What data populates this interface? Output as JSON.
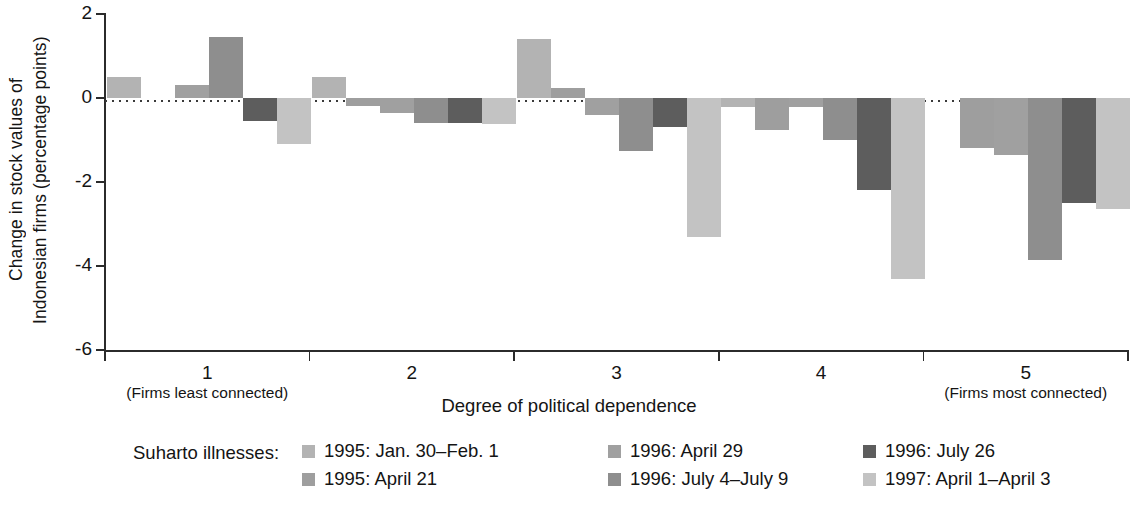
{
  "chart_data": {
    "type": "bar",
    "title": "",
    "xlabel": "Degree of political dependence",
    "ylabel": "Change in stock values of Indonesian firms (percentage points)",
    "ylabel_line1": "Change in stock values of",
    "ylabel_line2": "Indonesian firms (percentage points)",
    "ylim": [
      -6,
      2
    ],
    "yticks": [
      2,
      0,
      -2,
      -4,
      -6
    ],
    "ytick_labels": [
      "2",
      "0",
      "-2",
      "-4",
      "-6"
    ],
    "grid": false,
    "zero_line": true,
    "legend_position": "below",
    "legend_title": "Suharto illnesses:",
    "categories": [
      "1",
      "2",
      "3",
      "4",
      "5"
    ],
    "category_sublabels": [
      "(Firms least connected)",
      "",
      "",
      "",
      "(Firms most connected)"
    ],
    "series": [
      {
        "name": "1995: Jan. 30–Feb. 1",
        "color": "#b3b3b3",
        "values": [
          0.5,
          0.5,
          1.4,
          -0.22,
          null
        ]
      },
      {
        "name": "1995: April 21",
        "color": "#9e9e9e",
        "values": [
          null,
          -0.18,
          0.25,
          -0.75,
          -1.2
        ]
      },
      {
        "name": "1996: April 29",
        "color": "#a0a0a0",
        "values": [
          0.3,
          -0.35,
          -0.4,
          -0.22,
          -1.35
        ]
      },
      {
        "name": "1996: July 4–July 9",
        "color": "#8e8e8e",
        "values": [
          1.45,
          -0.6,
          -1.25,
          -1.0,
          -3.85
        ]
      },
      {
        "name": "1996: July 26",
        "color": "#5d5d5d",
        "values": [
          -0.55,
          -0.6,
          -0.7,
          -2.2,
          -2.5
        ]
      },
      {
        "name": "1997: April 1–April 3",
        "color": "#c3c3c3",
        "values": [
          -1.1,
          -0.62,
          -3.3,
          -4.3,
          -2.65
        ]
      }
    ]
  },
  "axis": {
    "ytick_2": "2",
    "ytick_0": "0",
    "ytick_m2": "-2",
    "ytick_m4": "-4",
    "ytick_m6": "-6",
    "xtitle": "Degree of political dependence",
    "x1": "1",
    "x2": "2",
    "x3": "3",
    "x4": "4",
    "x5": "5",
    "x1_sub": "(Firms least connected)",
    "x5_sub": "(Firms most connected)"
  },
  "legend": {
    "title": "Suharto illnesses:",
    "items": [
      {
        "label": "1995: Jan. 30–Feb. 1",
        "color": "#b3b3b3"
      },
      {
        "label": "1995: April 21",
        "color": "#9e9e9e"
      },
      {
        "label": "1996: April 29",
        "color": "#a0a0a0"
      },
      {
        "label": "1996: July 4–July 9",
        "color": "#8e8e8e"
      },
      {
        "label": "1996: July 26",
        "color": "#5d5d5d"
      },
      {
        "label": "1997: April 1–April 3",
        "color": "#c3c3c3"
      }
    ]
  },
  "footnote": {
    "text": ""
  }
}
